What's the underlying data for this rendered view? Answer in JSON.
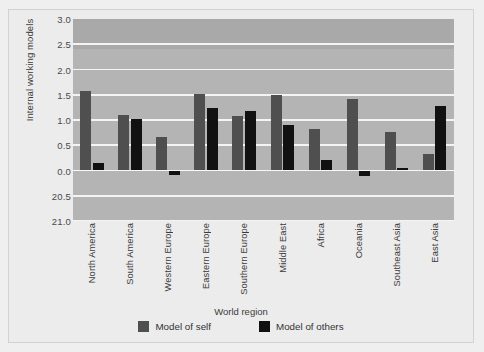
{
  "chart_data": {
    "type": "bar",
    "title": "",
    "xlabel": "World region",
    "ylabel": "Internal working models",
    "categories": [
      "North America",
      "South America",
      "Western Europe",
      "Eastern Europe",
      "Southern Europe",
      "Middle East",
      "Africa",
      "Oceania",
      "Southeast Asia",
      "East Asia"
    ],
    "series": [
      {
        "name": "Model of self",
        "color": "#4f4f4f",
        "values": [
          1.58,
          1.1,
          0.66,
          1.52,
          1.08,
          1.49,
          0.82,
          1.41,
          0.76,
          0.33
        ]
      },
      {
        "name": "Model of others",
        "color": "#111111",
        "values": [
          0.14,
          1.02,
          -0.08,
          1.24,
          1.18,
          0.9,
          0.2,
          -0.1,
          0.05,
          1.28
        ]
      }
    ],
    "ylim": [
      -1.0,
      3.0
    ],
    "yticks": [
      3.0,
      2.5,
      2.0,
      1.5,
      1.0,
      0.5,
      0.0,
      -0.5,
      -1.0
    ],
    "ytick_labels": [
      "3.0",
      "2.5",
      "2.0",
      "1.5",
      "1.0",
      "0.5",
      "0.0",
      "20.5",
      "21.0"
    ],
    "grid": true,
    "legend_position": "bottom",
    "plot_background": "#b4b4b4",
    "gridline_color": "#f4f4f4",
    "figure_background": "#ececec"
  }
}
